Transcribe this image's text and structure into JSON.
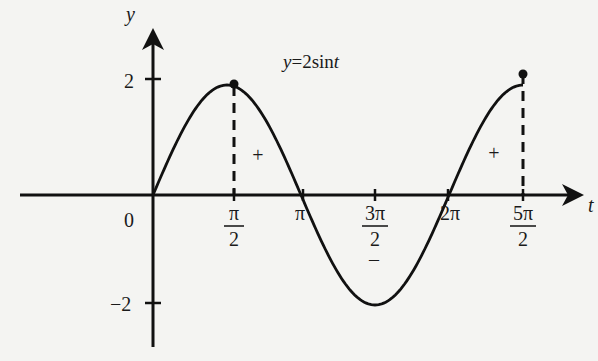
{
  "chart_data": {
    "type": "line",
    "title": "y=2sint",
    "xlabel": "t",
    "ylabel": "y",
    "function": "y = 2 sin t",
    "x_ticks": [
      {
        "value": 0,
        "label": "0"
      },
      {
        "value": 1.5708,
        "label_num": "π",
        "label_den": "2"
      },
      {
        "value": 3.1416,
        "label": "π"
      },
      {
        "value": 4.7124,
        "label_num": "3π",
        "label_den": "2"
      },
      {
        "value": 6.2832,
        "label": "2π"
      },
      {
        "value": 7.854,
        "label_num": "5π",
        "label_den": "2"
      }
    ],
    "y_ticks": [
      {
        "value": 2,
        "label": "2"
      },
      {
        "value": -2,
        "label": "−2"
      }
    ],
    "x": [
      0,
      0.7854,
      1.5708,
      2.3562,
      3.1416,
      3.927,
      4.7124,
      5.4978,
      6.2832,
      7.0686,
      7.854
    ],
    "y": [
      0,
      1.414,
      2,
      1.414,
      0,
      -1.414,
      -2,
      -1.414,
      0,
      1.414,
      2
    ],
    "xlim": [
      0,
      7.854
    ],
    "ylim": [
      -2,
      2
    ],
    "grid": false,
    "annotations": [
      {
        "text": "+",
        "near_x": 2.4,
        "meaning": "positive region"
      },
      {
        "text": "−",
        "near_x": 4.7,
        "meaning": "negative region"
      },
      {
        "text": "+",
        "near_x": 7.2,
        "meaning": "positive region"
      }
    ],
    "markers": [
      {
        "x": 1.5708,
        "y": 2,
        "dashed_drop": true
      },
      {
        "x": 7.854,
        "y": 2,
        "dashed_drop": true
      }
    ]
  },
  "labels": {
    "title": "y=2sint",
    "x_axis": "t",
    "y_axis": "y",
    "origin": "0",
    "y_top": "2",
    "y_bottom": "−2",
    "pi_half_num": "π",
    "pi_half_den": "2",
    "pi": "π",
    "three_pi_half_num": "3π",
    "three_pi_half_den": "2",
    "two_pi": "2π",
    "five_pi_half_num": "5π",
    "five_pi_half_den": "2",
    "plus1": "+",
    "minus": "–",
    "plus2": "+"
  }
}
